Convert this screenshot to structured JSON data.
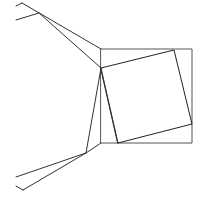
{
  "diagram": {
    "colors": {
      "background": "#ffffff",
      "outer_square": "#555555",
      "inner_square": "#222222",
      "connectors": "#333333"
    },
    "outer_square": {
      "points": [
        [
          101,
          49
        ],
        [
          192,
          49
        ],
        [
          192,
          143
        ],
        [
          101,
          143
        ]
      ]
    },
    "inner_square": {
      "points": [
        [
          101,
          68
        ],
        [
          174,
          50
        ],
        [
          192,
          124
        ],
        [
          118,
          143
        ]
      ]
    },
    "top_cluster": {
      "hub": [
        39,
        13
      ],
      "segments": [
        [
          [
            22,
            3
          ],
          [
            101,
            49
          ]
        ],
        [
          [
            39,
            13
          ],
          [
            101,
            68
          ]
        ],
        [
          [
            39,
            13
          ],
          [
            16,
            20
          ]
        ],
        [
          [
            22,
            3
          ],
          [
            16,
            6
          ]
        ]
      ]
    },
    "bottom_cluster": {
      "hub": [
        86,
        153
      ],
      "segments": [
        [
          [
            101,
            68
          ],
          [
            86,
            153
          ]
        ],
        [
          [
            101,
            143
          ],
          [
            86,
            153
          ]
        ],
        [
          [
            86,
            153
          ],
          [
            16,
            177
          ]
        ],
        [
          [
            101,
            68
          ],
          [
            118,
            143
          ]
        ],
        [
          [
            86,
            153
          ],
          [
            23,
            190
          ]
        ],
        [
          [
            23,
            190
          ],
          [
            16,
            186
          ]
        ]
      ]
    }
  }
}
